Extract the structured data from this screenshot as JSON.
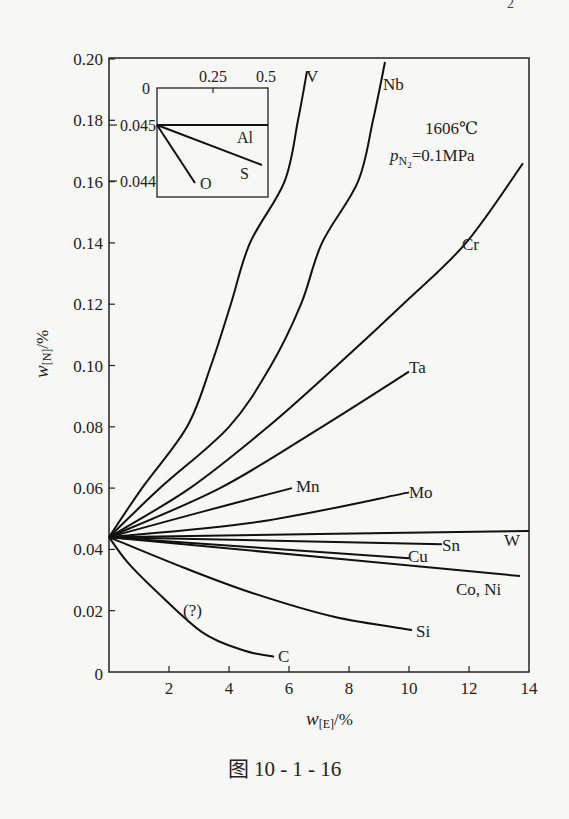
{
  "page_fragment": "2",
  "caption": "图 10 - 1 - 16",
  "chart_data": {
    "type": "line",
    "title": "",
    "xlabel": "w[E]/%",
    "ylabel": "w[N]/%",
    "xlim": [
      0,
      14
    ],
    "ylim": [
      0,
      0.2
    ],
    "x_ticks": [
      0,
      2,
      4,
      6,
      8,
      10,
      12,
      14
    ],
    "x_tick_labels": [
      "0",
      "2",
      "4",
      "6",
      "8",
      "10",
      "12",
      "14"
    ],
    "y_ticks": [
      0,
      0.02,
      0.04,
      0.06,
      0.08,
      0.1,
      0.12,
      0.14,
      0.16,
      0.18,
      0.2
    ],
    "y_tick_labels": [
      "0",
      "0.02",
      "0.04",
      "0.06",
      "0.08",
      "0.10",
      "0.12",
      "0.14",
      "0.16",
      "0.18",
      "0.20"
    ],
    "grid": false,
    "annotations": [
      {
        "text": "1606℃",
        "x": 10.7,
        "y": 0.177
      },
      {
        "text": "pN2=0.1MPa",
        "x": 10.6,
        "y": 0.168
      },
      {
        "text": "(?)",
        "x": 2.9,
        "y": 0.02
      }
    ],
    "series": [
      {
        "name": "V",
        "points": [
          [
            0,
            0.044
          ],
          [
            1.1,
            0.06
          ],
          [
            2.6,
            0.08
          ],
          [
            3.4,
            0.1
          ],
          [
            4.06,
            0.12
          ],
          [
            4.7,
            0.14
          ],
          [
            5.85,
            0.16
          ],
          [
            6.3,
            0.18
          ],
          [
            6.6,
            0.196
          ]
        ]
      },
      {
        "name": "Nb",
        "points": [
          [
            0,
            0.044
          ],
          [
            1.7,
            0.06
          ],
          [
            4.0,
            0.08
          ],
          [
            5.4,
            0.1
          ],
          [
            6.4,
            0.12
          ],
          [
            7.1,
            0.14
          ],
          [
            8.3,
            0.16
          ],
          [
            8.8,
            0.18
          ],
          [
            9.2,
            0.199
          ]
        ]
      },
      {
        "name": "Cr",
        "points": [
          [
            0,
            0.044
          ],
          [
            2.7,
            0.06
          ],
          [
            5.3,
            0.08
          ],
          [
            7.6,
            0.1
          ],
          [
            9.8,
            0.12
          ],
          [
            11.9,
            0.14
          ],
          [
            13.8,
            0.166
          ]
        ]
      },
      {
        "name": "Ta",
        "points": [
          [
            0,
            0.044
          ],
          [
            3.7,
            0.06
          ],
          [
            7.1,
            0.08
          ],
          [
            10.0,
            0.098
          ]
        ]
      },
      {
        "name": "Mn",
        "points": [
          [
            0,
            0.044
          ],
          [
            3.0,
            0.052
          ],
          [
            6.1,
            0.06
          ]
        ]
      },
      {
        "name": "Mo",
        "points": [
          [
            0,
            0.044
          ],
          [
            5.0,
            0.049
          ],
          [
            10.0,
            0.0586
          ]
        ]
      },
      {
        "name": "W",
        "points": [
          [
            0,
            0.044
          ],
          [
            14.0,
            0.046
          ]
        ]
      },
      {
        "name": "Sn",
        "points": [
          [
            0,
            0.044
          ],
          [
            11.1,
            0.0417
          ]
        ]
      },
      {
        "name": "Cu",
        "points": [
          [
            0,
            0.044
          ],
          [
            10.0,
            0.0371
          ]
        ]
      },
      {
        "name": "Co, Ni",
        "points": [
          [
            0,
            0.044
          ],
          [
            13.7,
            0.0313
          ]
        ]
      },
      {
        "name": "Si",
        "points": [
          [
            0,
            0.044
          ],
          [
            2.5,
            0.034
          ],
          [
            4.8,
            0.0257
          ],
          [
            7.5,
            0.018
          ],
          [
            10.1,
            0.0137
          ]
        ]
      },
      {
        "name": "C",
        "points": [
          [
            0,
            0.044
          ],
          [
            0.6,
            0.036
          ],
          [
            1.4,
            0.028
          ],
          [
            3.1,
            0.013
          ],
          [
            4.5,
            0.007
          ],
          [
            5.5,
            0.005
          ]
        ]
      }
    ],
    "inset": {
      "xlim": [
        0,
        0.5
      ],
      "ylim": [
        0.0437,
        0.0457
      ],
      "x_tick_labels": [
        "0",
        "0.25",
        "0.5"
      ],
      "y_tick_labels": [
        "0.045",
        "0.044"
      ],
      "series": [
        {
          "name": "Al",
          "points": [
            [
              0,
              0.045
            ],
            [
              0.5,
              0.045
            ]
          ]
        },
        {
          "name": "S",
          "points": [
            [
              0,
              0.045
            ],
            [
              0.473,
              0.04427
            ]
          ]
        },
        {
          "name": "O",
          "points": [
            [
              0,
              0.045
            ],
            [
              0.171,
              0.04395
            ]
          ]
        }
      ]
    }
  },
  "labels": {
    "V": "V",
    "Nb": "Nb",
    "Cr": "Cr",
    "Ta": "Ta",
    "Mn": "Mn",
    "Mo": "Mo",
    "W": "W",
    "Sn": "Sn",
    "Cu": "Cu",
    "CoNi": "Co, Ni",
    "Si": "Si",
    "C": "C",
    "Al": "Al",
    "S": "S",
    "O": "O",
    "question": "(?)",
    "temp": "1606℃",
    "pressure_p": "p",
    "pressure_sub": "N",
    "pressure_subsub": "2",
    "pressure_rest": "=0.1MPa",
    "xlabel_w": "w",
    "xlabel_sub": "[E]",
    "xlabel_rest": "/%",
    "ylabel_w": "w",
    "ylabel_sub": "[N]",
    "ylabel_rest": "/%"
  }
}
